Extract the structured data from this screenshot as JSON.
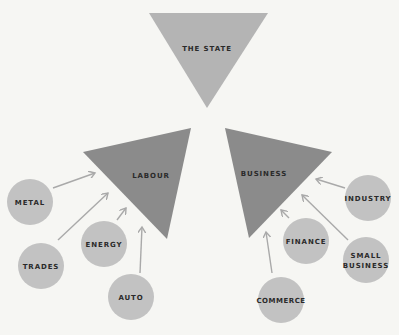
{
  "diagram": {
    "colors": {
      "background": "#f6f6f3",
      "state_triangle": "#b4b4b4",
      "group_triangle": "#8b8b8b",
      "circle": "#c2c2c2",
      "arrow": "#a9a9a9",
      "text": "#2a2a2a"
    },
    "state": {
      "label": "THE STATE"
    },
    "groups": {
      "labour": {
        "label": "LABOUR"
      },
      "business": {
        "label": "BUSINESS"
      }
    },
    "labour_members": [
      {
        "label": "METAL"
      },
      {
        "label": "TRADES"
      },
      {
        "label": "ENERGY"
      },
      {
        "label": "AUTO"
      }
    ],
    "business_members": [
      {
        "label": "INDUSTRY"
      },
      {
        "label": "FINANCE"
      },
      {
        "label_line1": "SMALL",
        "label_line2": "BUSINESS"
      },
      {
        "label": "COMMERCE"
      }
    ]
  }
}
